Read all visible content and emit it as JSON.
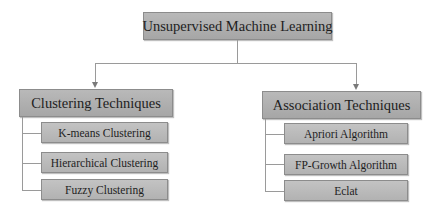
{
  "root": {
    "label": "Unsupervised Machine Learning"
  },
  "branches": [
    {
      "label": "Clustering Techniques",
      "children": [
        "K-means Clustering",
        "Hierarchical Clustering",
        "Fuzzy Clustering"
      ]
    },
    {
      "label": "Association Techniques",
      "children": [
        "Apriori Algorithm",
        "FP-Growth Algorithm",
        "Eclat"
      ]
    }
  ],
  "colors": {
    "box_fill": "#b0b0b0",
    "box_border": "#8c8c8c",
    "connector": "#9a9a9a",
    "text": "#1e1e1e"
  }
}
